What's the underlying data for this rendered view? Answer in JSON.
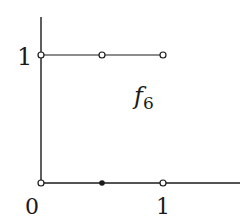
{
  "diagram": {
    "function_label": "f",
    "function_subscript": "6",
    "y_axis": {
      "tick_label": "1"
    },
    "x_axis": {
      "origin_label": "0",
      "tick_label": "1"
    },
    "colors": {
      "stroke": "#1a1a1a",
      "background": "#ffffff"
    },
    "segments": [
      {
        "name": "upper-segment",
        "from": [
          0,
          1
        ],
        "to": [
          1,
          1
        ]
      },
      {
        "name": "lower-segment",
        "from": [
          0,
          0
        ],
        "to": [
          1.6,
          0
        ]
      }
    ],
    "points": [
      {
        "name": "open-point-0-1",
        "x": 0,
        "y": 1,
        "type": "open"
      },
      {
        "name": "open-point-half-1",
        "x": 0.5,
        "y": 1,
        "type": "open"
      },
      {
        "name": "open-point-1-1",
        "x": 1,
        "y": 1,
        "type": "open"
      },
      {
        "name": "open-point-0-0",
        "x": 0,
        "y": 0,
        "type": "open"
      },
      {
        "name": "filled-point-half-0",
        "x": 0.5,
        "y": 0,
        "type": "filled"
      },
      {
        "name": "open-point-1-0",
        "x": 1,
        "y": 0,
        "type": "open"
      }
    ]
  }
}
